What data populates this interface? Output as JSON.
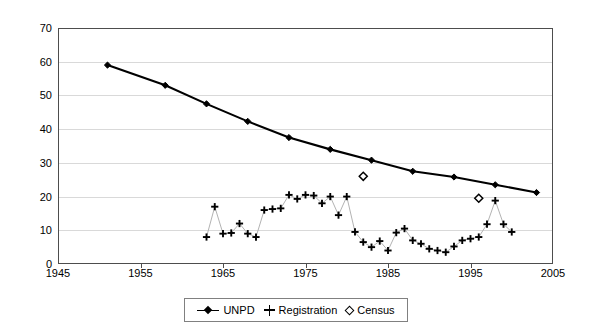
{
  "chart_data": {
    "type": "line",
    "title": "",
    "xlabel": "",
    "ylabel": "",
    "xlim": [
      1945,
      2005
    ],
    "ylim": [
      0,
      70
    ],
    "xticks": [
      1945,
      1955,
      1965,
      1975,
      1985,
      1995,
      2005
    ],
    "yticks": [
      0,
      10,
      20,
      30,
      40,
      50,
      60,
      70
    ],
    "grid": "horizontal",
    "legend_position": "bottom-center",
    "series": [
      {
        "name": "UNPD",
        "marker": "filled-diamond",
        "line": "solid-thick",
        "x": [
          1951,
          1958,
          1963,
          1968,
          1973,
          1978,
          1983,
          1988,
          1993,
          1998,
          2003
        ],
        "values": [
          59.0,
          53.0,
          47.5,
          42.3,
          37.5,
          34.0,
          30.8,
          27.5,
          25.8,
          23.5,
          21.2
        ]
      },
      {
        "name": "Registration",
        "marker": "plus",
        "line": "thin-grey",
        "x": [
          1963,
          1964,
          1965,
          1966,
          1967,
          1968,
          1969,
          1970,
          1971,
          1972,
          1973,
          1974,
          1975,
          1976,
          1977,
          1978,
          1979,
          1980,
          1981,
          1982,
          1983,
          1984,
          1985,
          1986,
          1987,
          1988,
          1989,
          1990,
          1991,
          1992,
          1993,
          1994,
          1995,
          1996,
          1997,
          1998,
          1999,
          2000
        ],
        "values": [
          8.0,
          17.0,
          9.0,
          9.2,
          12.0,
          9.0,
          8.0,
          16.0,
          16.3,
          16.5,
          20.5,
          19.3,
          20.5,
          20.3,
          18.0,
          20.0,
          14.5,
          20.0,
          9.5,
          6.5,
          5.0,
          6.8,
          4.0,
          9.3,
          10.5,
          7.0,
          6.0,
          4.5,
          4.0,
          3.5,
          5.2,
          7.0,
          7.5,
          8.0,
          11.8,
          18.8,
          11.8,
          9.5
        ]
      },
      {
        "name": "Census",
        "marker": "open-diamond",
        "line": "none",
        "x": [
          1982,
          1996
        ],
        "values": [
          26.0,
          19.5
        ]
      }
    ]
  },
  "legend": {
    "items": [
      {
        "label": "UNPD",
        "marker": "line-with-filled-diamond"
      },
      {
        "label": "Registration",
        "marker": "plus"
      },
      {
        "label": "Census",
        "marker": "open-diamond"
      }
    ]
  },
  "colors": {
    "series_line": "#000000",
    "registration_line": "#b3b3b3",
    "grid": "#d9d9d9",
    "axis": "#4d4d4d",
    "background": "#ffffff"
  }
}
